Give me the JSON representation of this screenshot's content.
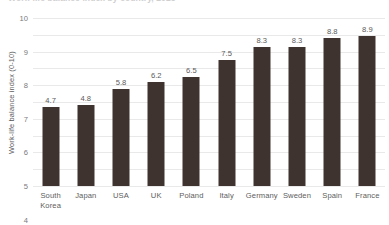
{
  "chart_data": {
    "type": "bar",
    "title": "Work-life balance index by country, 2023",
    "subtitle": "",
    "xlabel": "",
    "ylabel": "Work-life balance index (0-10)",
    "categories": [
      "South Korea",
      "Japan",
      "USA",
      "UK",
      "Poland",
      "Italy",
      "Germany",
      "Sweden",
      "Spain",
      "France"
    ],
    "category_lines": [
      [
        "South",
        "Korea"
      ],
      [
        "Japan"
      ],
      [
        "USA"
      ],
      [
        "UK"
      ],
      [
        "Poland"
      ],
      [
        "Italy"
      ],
      [
        "Germany"
      ],
      [
        "Sweden"
      ],
      [
        "Spain"
      ],
      [
        "France"
      ]
    ],
    "values": [
      4.7,
      4.8,
      5.8,
      6.2,
      6.5,
      7.5,
      8.3,
      8.3,
      8.8,
      8.9
    ],
    "value_labels": [
      "4.7",
      "4.8",
      "5.8",
      "6.2",
      "6.5",
      "7.5",
      "8.3",
      "8.3",
      "8.8",
      "8.9"
    ],
    "ylim": [
      0,
      10
    ],
    "yticks": [
      10,
      9,
      8,
      7,
      6,
      5,
      4,
      3,
      2,
      1,
      0
    ],
    "ytick_labels": [
      "10",
      "9",
      "8",
      "7",
      "6",
      "5",
      "4",
      "3",
      "2",
      "1",
      "0"
    ],
    "grid": true,
    "legend": false,
    "legend_position": "none",
    "bar_color": "#3f3330",
    "grid_color": "#e9e9e9",
    "text_color": "#5d5d5d"
  }
}
